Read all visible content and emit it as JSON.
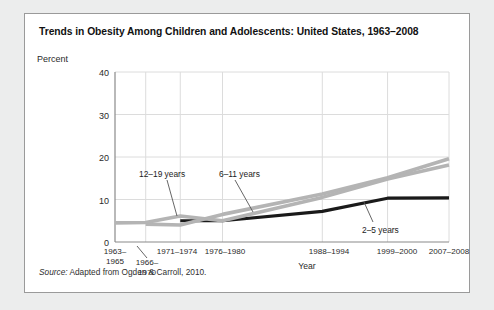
{
  "figure": {
    "title": "Trends in Obesity Among Children and Adolescents: United States, 1963–2008",
    "source_word": "Source:",
    "source_text": " Adapted from Ogden & Carroll, 2010."
  },
  "colors": {
    "card_background": "#ffffff",
    "card_border": "#9a9a9a",
    "page_background": "#eceded",
    "axis": "#8a8a8a",
    "grid": "#dcdcdc",
    "series_2_5": "#1a1a1a",
    "series_6_11": "#b4b4b4",
    "series_12_19": "#b4b4b4",
    "leader_line": "#555555",
    "text": "#2a2a2a"
  },
  "chart_data": {
    "type": "line",
    "title": "Trends in Obesity Among Children and Adolescents: United States, 1963–2008",
    "xlabel": "Year",
    "ylabel": "Percent",
    "categories": [
      "1963–1965",
      "1966–1970",
      "1971–1974",
      "1976–1980",
      "1988–1994",
      "1999–2000",
      "2007–2008"
    ],
    "x_positions": [
      1964,
      1968,
      1972.5,
      1978,
      1991,
      1999.5,
      2007.5
    ],
    "xlim": [
      1964,
      2007.5
    ],
    "ylim": [
      0,
      40
    ],
    "yticks": [
      0,
      10,
      20,
      30,
      40
    ],
    "grid": true,
    "legend": "annotations",
    "series": [
      {
        "name": "2–5 years",
        "color": "#1a1a1a",
        "x": [
          1972.5,
          1978,
          1991,
          1999.5,
          2007.5
        ],
        "values": [
          5.0,
          5.0,
          7.2,
          10.3,
          10.4
        ]
      },
      {
        "name": "6–11 years",
        "color": "#b4b4b4",
        "x": [
          1968,
          1972.5,
          1978,
          1991,
          1999.5,
          2007.5
        ],
        "values": [
          4.2,
          4.0,
          6.5,
          11.3,
          15.1,
          19.6
        ]
      },
      {
        "name": "12–19 years",
        "color": "#b4b4b4",
        "x": [
          1964,
          1968,
          1972.5,
          1978,
          1991,
          1999.5,
          2007.5
        ],
        "values": [
          4.5,
          4.6,
          6.1,
          5.0,
          10.5,
          14.8,
          18.1
        ]
      }
    ],
    "annotations": [
      {
        "label": "12–19 years",
        "label_x": 114,
        "label_y": 155,
        "leader_from_x": 142,
        "leader_from_y": 166,
        "leader_to_x": 152,
        "leader_to_y": 202
      },
      {
        "label": "6–11 years",
        "label_x": 194,
        "label_y": 155,
        "leader_from_x": 210,
        "leader_from_y": 166,
        "leader_to_x": 228,
        "leader_to_y": 198
      },
      {
        "label": "2–5 years",
        "label_x": 337,
        "label_y": 211,
        "leader_from_x": 348,
        "leader_from_y": 208,
        "leader_to_x": 339,
        "leader_to_y": 188
      }
    ]
  },
  "yticks_display": [
    {
      "label": "40",
      "top": 54
    },
    {
      "label": "30",
      "top": 97
    },
    {
      "label": "20",
      "top": 139
    },
    {
      "label": "10",
      "top": 182
    },
    {
      "label": "0",
      "top": 224
    }
  ],
  "xticks_display": [
    {
      "label": "1963–\n1965",
      "center": 90,
      "top": 233
    },
    {
      "label": "1966–\n1970",
      "center": 122,
      "top": 244
    },
    {
      "label": "1971–1974",
      "center": 152,
      "top": 233
    },
    {
      "label": "1976–1980",
      "center": 200,
      "top": 233
    },
    {
      "label": "1988–1994",
      "center": 304,
      "top": 233
    },
    {
      "label": "1999–2000",
      "center": 372,
      "top": 233
    },
    {
      "label": "2007–2008",
      "center": 424,
      "top": 233
    }
  ]
}
